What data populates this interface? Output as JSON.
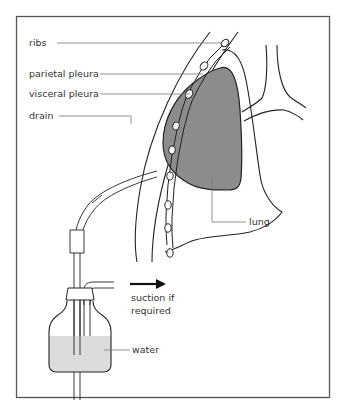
{
  "figure": {
    "type": "medical illustration"
  },
  "labels": {
    "ribs": "ribs",
    "parietal_pleura": "parietal pleura",
    "visceral_pleura": "visceral pleura",
    "drain": "drain",
    "lung": "lung",
    "suction_line1": "suction if",
    "suction_line2": "required",
    "water": "water"
  },
  "colors": {
    "frame": "#555555",
    "line": "#222222",
    "leader": "#777777",
    "lung_fill": "#8c8c8c",
    "water_fill": "#dcdcdc",
    "text": "#333333"
  }
}
